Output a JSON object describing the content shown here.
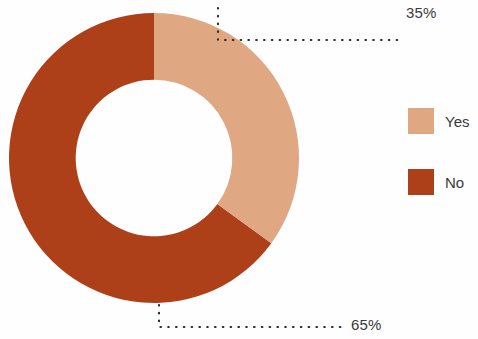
{
  "chart_data": {
    "type": "pie",
    "variant": "donut",
    "title": "",
    "subtitle": "",
    "xlabel": "",
    "ylabel": "",
    "grid": false,
    "legend_position": "right",
    "categories": [
      "Yes",
      "No"
    ],
    "values": [
      35,
      65
    ],
    "units": "percent",
    "start_angle_deg": 0,
    "direction": "clockwise",
    "inner_radius_ratio": 0.54,
    "slices": [
      {
        "label": "Yes",
        "value": 35,
        "data_label": "35%",
        "color": "#dfa782",
        "start_angle_deg": 0,
        "end_angle_deg": 126
      },
      {
        "label": "No",
        "value": 65,
        "data_label": "65%",
        "color": "#ae4019",
        "start_angle_deg": 126,
        "end_angle_deg": 360
      }
    ],
    "annotations": [
      {
        "text": "35%",
        "attached_to": "Yes",
        "leader": "dotted"
      },
      {
        "text": "65%",
        "attached_to": "No",
        "leader": "dotted"
      }
    ],
    "legend": [
      {
        "label": "Yes",
        "color": "#dfa782"
      },
      {
        "label": "No",
        "color": "#ae4019"
      }
    ]
  },
  "colors": {
    "yes": "#dfa782",
    "no": "#ae4019",
    "text": "#3a3a3a",
    "leader": "#2b2b2b",
    "background": "#fefefe"
  },
  "labels": {
    "top_percent": "35%",
    "bottom_percent": "65%"
  },
  "legend": {
    "items": [
      {
        "label": "Yes"
      },
      {
        "label": "No"
      }
    ]
  }
}
